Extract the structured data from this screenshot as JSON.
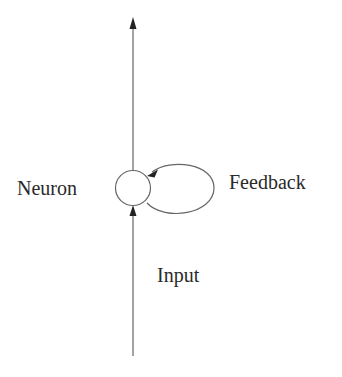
{
  "diagram": {
    "type": "recurrent-neuron",
    "nodes": [
      {
        "id": "neuron",
        "label": "Neuron",
        "shape": "circle"
      }
    ],
    "edges": [
      {
        "id": "input",
        "label": "Input",
        "from": "bottom",
        "to": "neuron",
        "direction": "up"
      },
      {
        "id": "output",
        "label": "",
        "from": "neuron",
        "to": "top",
        "direction": "up"
      },
      {
        "id": "feedback",
        "label": "Feedback",
        "from": "neuron",
        "to": "neuron",
        "type": "self-loop"
      }
    ]
  },
  "labels": {
    "neuron": "Neuron",
    "feedback": "Feedback",
    "input": "Input"
  },
  "colors": {
    "stroke": "#555555",
    "text": "#2a2a2a",
    "background": "#ffffff"
  }
}
